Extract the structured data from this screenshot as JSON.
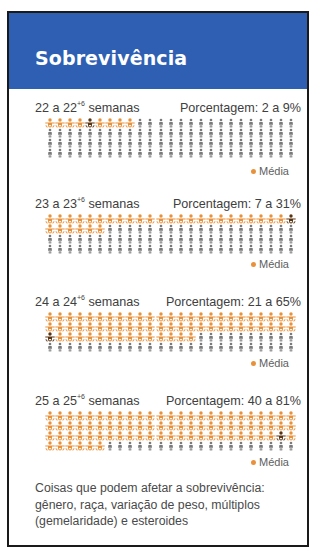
{
  "title": "Sobrevivência",
  "colors": {
    "header_bg": "#2f5fb3",
    "survivor": "#e8913a",
    "median": "#5a3410",
    "other": "#7a7a7a",
    "border": "#1a1a1a"
  },
  "legend_label": "Média",
  "sections": [
    {
      "weeks_base": "22 a 22",
      "weeks_sup": "+6",
      "weeks_suffix": " semanas",
      "pct_label": "Porcentagem: 2 a 9%",
      "low": 2,
      "high": 9,
      "median_index": 5
    },
    {
      "weeks_base": "23 a 23",
      "weeks_sup": "+6",
      "weeks_suffix": " semanas",
      "pct_label": "Porcentagem: 7 a 31%",
      "low": 7,
      "high": 31,
      "median_index": 25
    },
    {
      "weeks_base": "24 a 24",
      "weeks_sup": "+6",
      "weeks_suffix": " semanas",
      "pct_label": "Porcentagem: 21 a 65%",
      "low": 21,
      "high": 65,
      "median_index": 51
    },
    {
      "weeks_base": "25 a 25",
      "weeks_sup": "+6",
      "weeks_suffix": " semanas",
      "pct_label": "Porcentagem: 40 a 81%",
      "low": 40,
      "high": 81,
      "median_index": 74
    }
  ],
  "footnote": "Coisas que podem afetar a sobrevivência: gênero, raça, variação de peso, múltiplos (gemelaridade) e esteroides",
  "chart_data": {
    "type": "pictogram",
    "title": "Sobrevivência",
    "units_per_grid": 100,
    "grid_columns": 25,
    "grid_rows": 4,
    "legend": [
      {
        "label": "Média",
        "color": "#e8913a"
      }
    ],
    "categories": [
      "22 a 22+6 semanas",
      "23 a 23+6 semanas",
      "24 a 24+6 semanas",
      "25 a 25+6 semanas"
    ],
    "series": [
      {
        "name": "Porcentagem mínima",
        "values": [
          2,
          7,
          21,
          40
        ]
      },
      {
        "name": "Porcentagem máxima",
        "values": [
          9,
          31,
          65,
          81
        ]
      },
      {
        "name": "Média (posição aproximada)",
        "values": [
          5,
          25,
          51,
          74
        ]
      }
    ],
    "ylabel": "Porcentagem de sobrevivência",
    "ylim": [
      0,
      100
    ]
  }
}
